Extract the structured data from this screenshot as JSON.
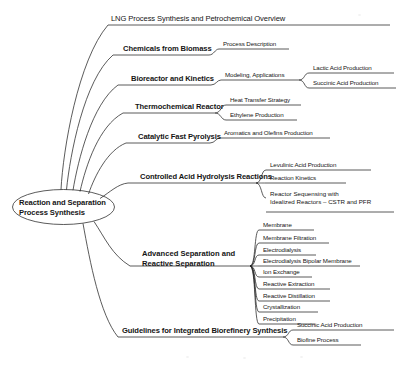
{
  "diagram": {
    "type": "mind-map",
    "title": "Reaction and Separation Process Synthesis",
    "root": {
      "label_line1": "Reaction and Separation",
      "label_line2": "Process Synthesis",
      "shape": "ellipse"
    },
    "branches": [
      {
        "label": "LNG Process Synthesis and Petrochemical Overview",
        "bold": false,
        "children": []
      },
      {
        "label": "Chemicals from Biomass",
        "bold": true,
        "children": [
          {
            "label": "Process Description",
            "children": []
          }
        ]
      },
      {
        "label": "Bioreactor and Kinetics",
        "bold": true,
        "children": [
          {
            "label": "Modeling, Applications",
            "children": [
              {
                "label": "Lactic Acid Production"
              },
              {
                "label": "Succinic Acid Production"
              }
            ]
          }
        ]
      },
      {
        "label": "Thermochemical Reactor",
        "bold": true,
        "children": [
          {
            "label": "Heat Transfer Strategy",
            "children": []
          },
          {
            "label": "Ethylene Production",
            "children": []
          }
        ]
      },
      {
        "label": "Catalytic Fast Pyrolysis",
        "bold": true,
        "children": [
          {
            "label": "Aromatics and Olefins Production",
            "children": []
          }
        ]
      },
      {
        "label": "Controlled Acid Hydrolysis Reactions",
        "bold": true,
        "children": [
          {
            "label": "Levulinic Acid Production",
            "children": []
          },
          {
            "label": "Reaction Kinetics",
            "children": []
          },
          {
            "label": "Reactor Sequensing with Idealized Reactors – CSTR and PFR",
            "line1": "Reactor Sequensing with",
            "line2": "Idealized Reactors – CSTR and PFR",
            "children": []
          }
        ]
      },
      {
        "label": "Advanced Separation and Reactive Separation",
        "line1": "Advanced Separation and",
        "line2": "Reactive Separation",
        "bold": true,
        "children": [
          {
            "label": "Membrane"
          },
          {
            "label": "Membrane Filtration"
          },
          {
            "label": "Electrodialysis"
          },
          {
            "label": "Electrodialysis Bipolar Membrane"
          },
          {
            "label": "Ion Exchange"
          },
          {
            "label": "Reactive Extraction"
          },
          {
            "label": "Reactive Distillation"
          },
          {
            "label": "Crystallization"
          },
          {
            "label": "Precipitation"
          }
        ]
      },
      {
        "label": "Guidelines for Integrated Biorefinery Synthesis",
        "bold": true,
        "children": [
          {
            "label": "Succinic Acid Production"
          },
          {
            "label": "Biofine Process"
          }
        ]
      }
    ],
    "colors": {
      "stroke": "#242424",
      "text": "#151515",
      "background": "#ffffff"
    }
  }
}
